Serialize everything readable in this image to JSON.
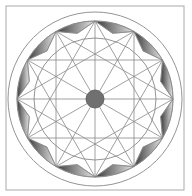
{
  "diagram": {
    "type": "geometric-rosette",
    "frame": {
      "x": 6,
      "y": 6,
      "width": 178,
      "height": 184,
      "stroke": "#aaaaaa"
    },
    "center": {
      "x": 95,
      "y": 99
    },
    "circles": {
      "outer_radius": 87,
      "band_radius": 78,
      "inner_radius": 61,
      "hub_radius": 9
    },
    "star": {
      "points": 12,
      "outer_vertex_radius": 78,
      "inner_vertex_radius": 68,
      "chord_step": 4
    },
    "colors": {
      "line": "#888888",
      "shade_dark": "#3a3a3a",
      "shade_light": "#e6e6e6",
      "hub": "#707070",
      "background": "#ffffff"
    }
  }
}
